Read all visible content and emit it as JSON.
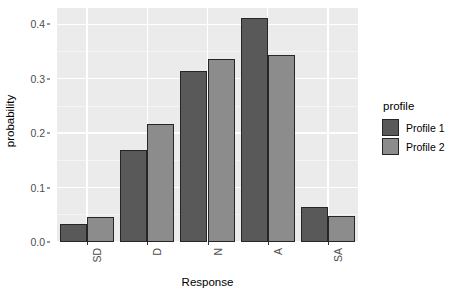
{
  "chart_data": {
    "type": "bar",
    "title": "",
    "xlabel": "Response",
    "ylabel": "probability",
    "categories": [
      "SD",
      "D",
      "N",
      "A",
      "SA"
    ],
    "series": [
      {
        "name": "Profile 1",
        "color": "#595959",
        "values": [
          0.033,
          0.169,
          0.314,
          0.412,
          0.065
        ]
      },
      {
        "name": "Profile 2",
        "color": "#8c8c8c",
        "values": [
          0.046,
          0.216,
          0.336,
          0.343,
          0.048
        ]
      }
    ],
    "ylim": [
      0,
      0.43
    ],
    "y_ticks": [
      0.0,
      0.1,
      0.2,
      0.3,
      0.4
    ],
    "y_tick_labels": [
      "0.0",
      "0.1",
      "0.2",
      "0.3",
      "0.4"
    ],
    "grid": true,
    "grid_color": "#ffffff",
    "panel_background": "#ebebeb",
    "legend_position": "right",
    "legend_title": "profile",
    "bar_outline_color": "#262626",
    "x_tick_rotation": 90
  }
}
